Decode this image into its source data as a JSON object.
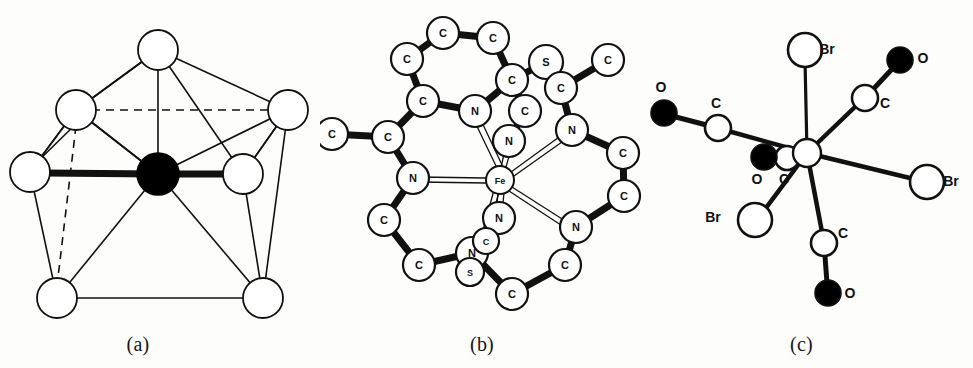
{
  "figure": {
    "background_color": "#fdfdfb",
    "stroke_color": "#111111",
    "atom_fill_open": "#ffffff",
    "atom_fill_solid": "#000000",
    "panels": [
      {
        "id": "a",
        "caption": "(a)"
      },
      {
        "id": "b",
        "caption": "(b)"
      },
      {
        "id": "c",
        "caption": "(c)"
      }
    ]
  },
  "panel_a": {
    "caption": "(a)",
    "description": "pentagonal-bipyramid coordination polyhedron",
    "center_atom": {
      "label": "",
      "cx": 158,
      "cy": 174,
      "r": 21,
      "fill": "solid"
    },
    "vertices": [
      {
        "id": "top",
        "cx": 158,
        "cy": 50,
        "r": 20,
        "fill": "open"
      },
      {
        "id": "upper-left",
        "cx": 76,
        "cy": 110,
        "r": 20,
        "fill": "open"
      },
      {
        "id": "upper-right",
        "cx": 288,
        "cy": 110,
        "r": 20,
        "fill": "open"
      },
      {
        "id": "left",
        "cx": 30,
        "cy": 172,
        "r": 20,
        "fill": "open"
      },
      {
        "id": "right",
        "cx": 243,
        "cy": 174,
        "r": 20,
        "fill": "open"
      },
      {
        "id": "lower-left",
        "cx": 57,
        "cy": 298,
        "r": 20,
        "fill": "open"
      },
      {
        "id": "lower-right",
        "cx": 263,
        "cy": 298,
        "r": 20,
        "fill": "open"
      }
    ],
    "bold_bonds": [
      {
        "from": "left",
        "to": "center"
      },
      {
        "from": "center",
        "to": "right"
      }
    ],
    "dashed_bonds": [
      {
        "from": "upper-left",
        "to": "upper-right"
      },
      {
        "from": "upper-left",
        "to": "lower-left"
      }
    ]
  },
  "panel_b": {
    "caption": "(b)",
    "description": "iron macrocyclic complex, seven-coordinate",
    "metal": {
      "label": "Fe",
      "cx": 180,
      "cy": 180,
      "r": 14
    },
    "atoms": [
      {
        "label": "C",
        "cx": 123,
        "cy": 33,
        "r": 16
      },
      {
        "label": "C",
        "cx": 173,
        "cy": 38,
        "r": 16
      },
      {
        "label": "C",
        "cx": 87,
        "cy": 59,
        "r": 16
      },
      {
        "label": "C",
        "cx": 192,
        "cy": 80,
        "r": 16
      },
      {
        "label": "C",
        "cx": 103,
        "cy": 101,
        "r": 16
      },
      {
        "label": "N",
        "cx": 155,
        "cy": 111,
        "r": 16
      },
      {
        "label": "S",
        "cx": 226,
        "cy": 62,
        "r": 17
      },
      {
        "label": "C",
        "cx": 205,
        "cy": 111,
        "r": 16
      },
      {
        "label": "C",
        "cx": 241,
        "cy": 88,
        "r": 16
      },
      {
        "label": "C",
        "cx": 288,
        "cy": 60,
        "r": 16
      },
      {
        "label": "N",
        "cx": 189,
        "cy": 141,
        "r": 16
      },
      {
        "label": "N",
        "cx": 252,
        "cy": 130,
        "r": 16
      },
      {
        "label": "C",
        "cx": 12,
        "cy": 134,
        "r": 16
      },
      {
        "label": "C",
        "cx": 68,
        "cy": 137,
        "r": 16
      },
      {
        "label": "N",
        "cx": 93,
        "cy": 178,
        "r": 16
      },
      {
        "label": "C",
        "cx": 303,
        "cy": 153,
        "r": 16
      },
      {
        "label": "C",
        "cx": 304,
        "cy": 196,
        "r": 16
      },
      {
        "label": "C",
        "cx": 64,
        "cy": 220,
        "r": 16
      },
      {
        "label": "N",
        "cx": 256,
        "cy": 227,
        "r": 16
      },
      {
        "label": "C",
        "cx": 99,
        "cy": 265,
        "r": 16
      },
      {
        "label": "N",
        "cx": 152,
        "cy": 253,
        "r": 16
      },
      {
        "label": "N",
        "cx": 179,
        "cy": 218,
        "r": 16
      },
      {
        "label": "C",
        "cx": 166,
        "cy": 241,
        "r": 13
      },
      {
        "label": "S",
        "cx": 150,
        "cy": 272,
        "r": 14
      },
      {
        "label": "C",
        "cx": 245,
        "cy": 265,
        "r": 16
      },
      {
        "label": "C",
        "cx": 192,
        "cy": 294,
        "r": 16
      }
    ]
  },
  "panel_c": {
    "caption": "(c)",
    "description": "seven-coordinate carbonyl bromide complex",
    "metal": {
      "label": "",
      "cx": 157,
      "cy": 153,
      "r": 14
    },
    "ligand_atoms": [
      {
        "label": "Br",
        "cx": 155,
        "cy": 50,
        "r": 17,
        "fill": "open",
        "label_dx": 22,
        "label_dy": 4
      },
      {
        "label": "Br",
        "cx": 277,
        "cy": 182,
        "r": 17,
        "fill": "open",
        "label_dx": 24,
        "label_dy": 4
      },
      {
        "label": "Br",
        "cx": 105,
        "cy": 220,
        "r": 17,
        "fill": "open",
        "label_dx": -42,
        "label_dy": 2
      },
      {
        "label": "C",
        "cx": 68,
        "cy": 128,
        "r": 13,
        "fill": "open",
        "label_dx": -2,
        "label_dy": -20
      },
      {
        "label": "O",
        "cx": 14,
        "cy": 113,
        "r": 13,
        "fill": "solid",
        "label_dx": -3,
        "label_dy": -21
      },
      {
        "label": "C",
        "cx": 215,
        "cy": 98,
        "r": 13,
        "fill": "open",
        "label_dx": 20,
        "label_dy": 10
      },
      {
        "label": "O",
        "cx": 250,
        "cy": 60,
        "r": 13,
        "fill": "solid",
        "label_dx": 23,
        "label_dy": 3
      },
      {
        "label": "C",
        "cx": 174,
        "cy": 243,
        "r": 13,
        "fill": "open",
        "label_dx": 19,
        "label_dy": -5
      },
      {
        "label": "O",
        "cx": 178,
        "cy": 293,
        "r": 13,
        "fill": "solid",
        "label_dx": 22,
        "label_dy": 5
      },
      {
        "label": "C",
        "cx": 137,
        "cy": 158,
        "r": 12,
        "fill": "open",
        "label_dx": -3,
        "label_dy": 26
      },
      {
        "label": "O",
        "cx": 114,
        "cy": 157,
        "r": 13,
        "fill": "solid",
        "label_dx": -7,
        "label_dy": 27
      }
    ]
  }
}
